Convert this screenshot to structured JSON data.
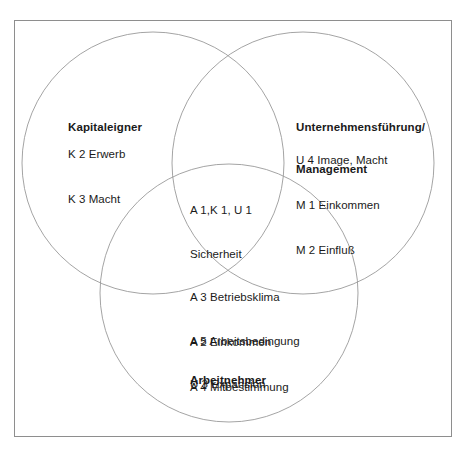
{
  "diagram": {
    "type": "venn",
    "title": "",
    "frame": {
      "border_color": "#8e8e8e"
    },
    "circle_color": "#9a9a9a",
    "groups": [
      {
        "id": "kapitaleigner",
        "title": "Kapitaleigner",
        "title_lines": [
          "Kapitaleigner"
        ],
        "items": [
          "K 2 Erwerb",
          "K 3 Macht"
        ]
      },
      {
        "id": "unternehmensfuehrung-management",
        "title": "Unternehmensführung/ Management",
        "title_lines": [
          "Unternehmensführung/",
          "Management"
        ],
        "items": [
          "U 4 Image, Macht",
          "M 1 Einkommen",
          "M 2 Einfluß"
        ]
      },
      {
        "id": "arbeitnehmer",
        "title": "Arbeitnehmer",
        "title_lines": [
          "Arbeitnehmer"
        ],
        "items": [
          "A 2 Einkommen",
          "A 4 Mitbestimmung"
        ]
      }
    ],
    "intersection": {
      "id": "center-intersection",
      "items": [
        "A 1,K 1, U 1",
        "Sicherheit",
        "A 3 Betriebsklima",
        "A 5 Arbeitsbedingung",
        "U 3 Expansion"
      ]
    }
  },
  "labels": {
    "capital_title_line1": "Kapitaleigner",
    "capital_item1": "K 2 Erwerb",
    "capital_item2": "K 3 Macht",
    "management_title_line1": "Unternehmensführung/",
    "management_title_line2": "Management",
    "management_item1": "U 4 Image, Macht",
    "management_item2": "M 1 Einkommen",
    "management_item3": "M 2 Einfluß",
    "center_item1": "A 1,K 1, U 1",
    "center_item2": "Sicherheit",
    "center_item3": "A 3 Betriebsklima",
    "center_item4": "A 5 Arbeitsbedingung",
    "center_item5": "U 3 Expansion",
    "labour_item1": "A 2 Einkommen",
    "labour_item2": "A 4 Mitbestimmung",
    "labour_title_line1": "Arbeitnehmer"
  }
}
